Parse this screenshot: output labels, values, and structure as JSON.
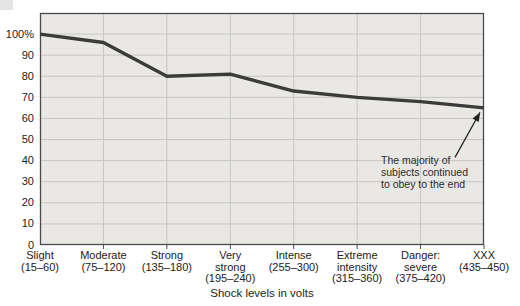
{
  "page": {
    "background": "#ffffff"
  },
  "chart_data": {
    "type": "line",
    "title": "",
    "xlabel": "Shock levels in volts",
    "ylabel": "",
    "categories": [
      "Slight\n(15–60)",
      "Moderate\n(75–120)",
      "Strong\n(135–180)",
      "Very\nstrong\n(195–240)",
      "Intense\n(255–300)",
      "Extreme\nintensity\n(315–360)",
      "Danger:\nsevere\n(375–420)",
      "XXX\n(435–450)"
    ],
    "values": [
      100,
      96,
      80,
      81,
      73,
      70,
      68,
      65
    ],
    "yticks": [
      0,
      10,
      20,
      30,
      40,
      50,
      60,
      70,
      80,
      90,
      100
    ],
    "ytick_labels": [
      "0",
      "10",
      "20",
      "30",
      "40",
      "50",
      "60",
      "70",
      "80",
      "90",
      "100%"
    ],
    "ylim": [
      0,
      110
    ],
    "grid": true,
    "legend": "none",
    "annotation": {
      "text": "The majority of\nsubjects continued\nto obey to the end"
    },
    "colors": {
      "line": "#3b3b3b",
      "plot_bg": "#e9e8e5",
      "gridline": "#c7c6c2",
      "border": "#4a4a4a",
      "text": "#222222",
      "arrow": "#222222"
    }
  }
}
